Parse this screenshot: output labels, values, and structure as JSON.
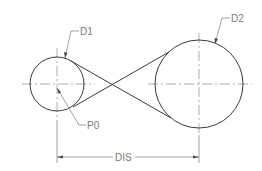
{
  "diagram": {
    "type": "technical-drawing",
    "circles": [
      {
        "id": "D1",
        "label": "D1",
        "cx": 57,
        "cy": 84,
        "r": 27
      },
      {
        "id": "D2",
        "label": "D2",
        "cx": 199,
        "cy": 84,
        "r": 44
      }
    ],
    "point_label": "P0",
    "dimension_label": "DIS",
    "colors": {
      "geometry": "#3a3a3a",
      "centerline": "#9a9a9a",
      "annotation": "#7a7a7a"
    }
  }
}
